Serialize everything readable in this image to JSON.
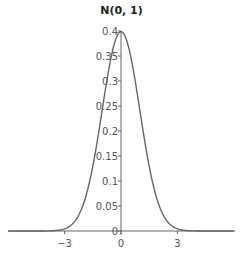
{
  "chart_data": {
    "type": "line",
    "title": "N(0, 1)",
    "xlabel": "",
    "ylabel": "",
    "xlim": [
      -6.1,
      6.1
    ],
    "ylim": [
      0,
      0.4
    ],
    "x_ticks": [
      -3,
      0,
      3
    ],
    "x_tick_labels": [
      "−3",
      "0",
      "3"
    ],
    "y_ticks": [
      0,
      0.05,
      0.1,
      0.15,
      0.2,
      0.25,
      0.3,
      0.35,
      0.4
    ],
    "y_tick_labels": [
      "0",
      "0.05",
      "0.1",
      "0.15",
      "0.2",
      "0.25",
      "0.3",
      "0.35",
      "0.4"
    ],
    "grid": false,
    "legend": null,
    "series": [
      {
        "name": "N(0, 1) density",
        "x": [
          -6,
          -3,
          -2.5,
          -2,
          -1.5,
          -1,
          -0.5,
          0,
          0.5,
          1,
          1.5,
          2,
          2.5,
          3,
          6
        ],
        "values": [
          0.0,
          0.0044,
          0.0175,
          0.054,
          0.1295,
          0.242,
          0.3521,
          0.3989,
          0.3521,
          0.242,
          0.1295,
          0.054,
          0.0175,
          0.0044,
          0.0
        ]
      }
    ],
    "colors": {
      "line": "#666666",
      "axis": "#666666",
      "text": "#555555"
    }
  }
}
